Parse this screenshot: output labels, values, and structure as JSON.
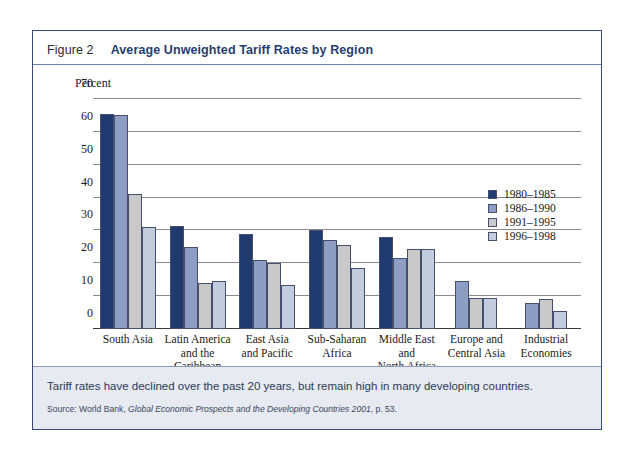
{
  "figure": {
    "number_label": "Figure 2",
    "title": "Average Unweighted Tariff Rates by Region",
    "caption": "Tariff rates have declined over the past 20 years, but remain high in many developing countries.",
    "source_prefix": "Source: World Bank, ",
    "source_italic": "Global Economic Prospects and the Developing Countries 2001",
    "source_suffix": ", p. 53."
  },
  "colors": {
    "border": "#3a4a7a",
    "title_accent": "#27406f",
    "footer_bg": "#e7eaf1",
    "series_1980_1985": "#203a70",
    "series_1986_1990": "#8e9dc4",
    "series_1991_1995": "#c9c9c9",
    "series_1996_1998": "#c2ccdd"
  },
  "chart_data": {
    "type": "bar",
    "title": "Average Unweighted Tariff Rates by Region",
    "xlabel": "",
    "ylabel": "Percent",
    "ylim": [
      0,
      70
    ],
    "yticks": [
      0,
      10,
      20,
      30,
      40,
      50,
      60,
      70
    ],
    "ytick_labels": [
      "0",
      "10",
      "20",
      "30",
      "40",
      "50",
      "60",
      "70"
    ],
    "grid": "horizontal",
    "legend_position": "inside-upper-right",
    "categories": [
      "South Asia",
      "Latin America and the Caribbean",
      "East Asia and Pacific",
      "Sub-Saharan Africa",
      "Middle East and North Africa",
      "Europe and Central Asia",
      "Industrial Economies"
    ],
    "category_lines": [
      [
        "South Asia"
      ],
      [
        "Latin America",
        "and the",
        "Caribbean"
      ],
      [
        "East Asia",
        "and Pacific"
      ],
      [
        "Sub-Saharan",
        "Africa"
      ],
      [
        "Middle East",
        "and",
        "North Africa"
      ],
      [
        "Europe and",
        "Central Asia"
      ],
      [
        "Industrial",
        "Economies"
      ]
    ],
    "series": [
      {
        "name": "1980–1985",
        "color": "#203a70",
        "values": [
          65.5,
          31.5,
          29.0,
          30.0,
          28.0,
          null,
          null
        ]
      },
      {
        "name": "1986–1990",
        "color": "#8e9dc4",
        "values": [
          65.0,
          25.0,
          21.0,
          27.0,
          21.5,
          14.5,
          8.0
        ]
      },
      {
        "name": "1991–1995",
        "color": "#c9c9c9",
        "values": [
          41.0,
          14.0,
          20.0,
          25.5,
          24.5,
          9.5,
          9.0
        ]
      },
      {
        "name": "1996–1998",
        "color": "#c2ccdd",
        "values": [
          31.0,
          14.5,
          13.5,
          18.5,
          24.5,
          9.5,
          5.5
        ]
      }
    ]
  }
}
